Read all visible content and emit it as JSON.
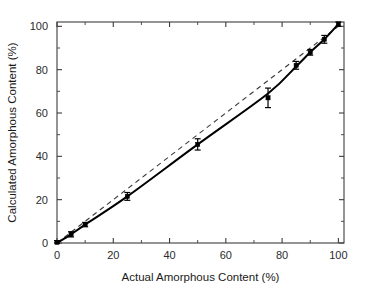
{
  "figure": {
    "background_color": "#ffffff",
    "plot_area": {
      "left": 57,
      "top": 22,
      "right": 344,
      "bottom": 243
    }
  },
  "chart_data": {
    "type": "scatter",
    "title": "",
    "subtitle": "",
    "xlabel": "Actual Amorphous Content (%)",
    "ylabel": "Calculated Amorphous Content (%)",
    "xlim": [
      0,
      102
    ],
    "ylim": [
      0,
      102
    ],
    "xticks": [
      0,
      20,
      40,
      60,
      80,
      100
    ],
    "yticks": [
      0,
      20,
      40,
      60,
      80,
      100
    ],
    "xtick_labels": [
      "0",
      "20",
      "40",
      "60",
      "80",
      "100"
    ],
    "ytick_labels": [
      "0",
      "20",
      "40",
      "60",
      "80",
      "100"
    ],
    "xminor_ticks": [
      10,
      30,
      50,
      70,
      90
    ],
    "yminor_ticks": [
      10,
      30,
      50,
      70,
      90
    ],
    "grid": false,
    "legend": false,
    "legend_position": "none",
    "marker_style": "filled-square",
    "marker_color": "#000000",
    "series": [
      {
        "name": "Measured data",
        "type": "scatter",
        "x": [
          0,
          5,
          10,
          25,
          50,
          75,
          85,
          90,
          95,
          100
        ],
        "y": [
          0.3,
          4.0,
          8.5,
          21.5,
          45.5,
          67.0,
          82.0,
          88.0,
          94.0,
          101.0
        ],
        "yerr": [
          0.8,
          1.2,
          1.0,
          1.8,
          2.6,
          4.5,
          1.8,
          1.3,
          1.8,
          1.0
        ]
      },
      {
        "name": "Fitted calibration curve",
        "type": "line",
        "style": "solid",
        "color": "#000000",
        "x": [
          0,
          5,
          10,
          25,
          50,
          75,
          85,
          90,
          95,
          100
        ],
        "y": [
          0.0,
          4.0,
          8.5,
          21.5,
          45.5,
          69.0,
          81.5,
          88.0,
          94.0,
          101.0
        ]
      },
      {
        "name": "1:1 reference line",
        "type": "line",
        "style": "dashed",
        "color": "#3a3a3a",
        "x": [
          0,
          100
        ],
        "y": [
          0,
          100
        ]
      }
    ],
    "annotations": []
  }
}
